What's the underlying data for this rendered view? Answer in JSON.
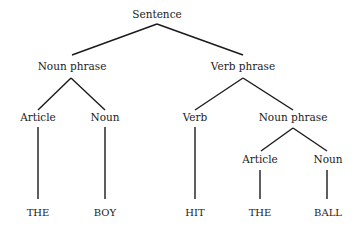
{
  "diagram": {
    "type": "parse-tree",
    "nodes": {
      "sentence": "Sentence",
      "noun_phrase_1": "Noun phrase",
      "verb_phrase": "Verb phrase",
      "article_1": "Article",
      "noun_1": "Noun",
      "verb": "Verb",
      "noun_phrase_2": "Noun phrase",
      "article_2": "Article",
      "noun_2": "Noun"
    },
    "terminals": {
      "the_1": "THE",
      "boy": "BOY",
      "hit": "HIT",
      "the_2": "THE",
      "ball": "BALL"
    },
    "edges": [
      [
        "Sentence",
        "Noun phrase"
      ],
      [
        "Sentence",
        "Verb phrase"
      ],
      [
        "Noun phrase",
        "Article"
      ],
      [
        "Noun phrase",
        "Noun"
      ],
      [
        "Verb phrase",
        "Verb"
      ],
      [
        "Verb phrase",
        "Noun phrase"
      ],
      [
        "Article",
        "THE"
      ],
      [
        "Noun",
        "BOY"
      ],
      [
        "Verb",
        "HIT"
      ],
      [
        "Noun phrase",
        "Article"
      ],
      [
        "Noun phrase",
        "Noun"
      ],
      [
        "Article",
        "THE"
      ],
      [
        "Noun",
        "BALL"
      ]
    ],
    "colors": {
      "line": "#1a1a1a",
      "text": "#222222",
      "background": "#ffffff"
    }
  }
}
